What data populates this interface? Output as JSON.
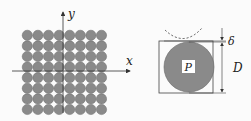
{
  "left_panel": {
    "grid_rows": 8,
    "grid_cols": 8,
    "x_label": "x",
    "y_label": "y",
    "circle_color": "#8a8a8a"
  },
  "right_panel": {
    "center_label": "P",
    "gap_label": "δ",
    "diameter_label": "D",
    "circle_color": "#8a8a8a"
  }
}
